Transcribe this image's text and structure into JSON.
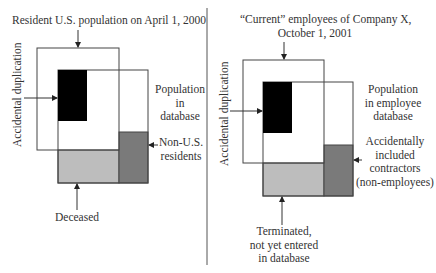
{
  "colors": {
    "black_block": "#000000",
    "dark_gray_block": "#7a7a7a",
    "light_gray_block": "#bdbdbd",
    "lines": "#333333"
  },
  "left_panel": {
    "title": "Resident U.S. population on April 1, 2000",
    "side_label": "Accidental duplication",
    "database_label_lines": [
      "Population",
      "in",
      "database"
    ],
    "right_arrow_label_lines": [
      "Non-U.S.",
      "residents"
    ],
    "bottom_label": "Deceased"
  },
  "right_panel": {
    "title_lines": [
      "“Current” employees of Company X,",
      "October 1, 2001"
    ],
    "side_label": "Accidental duplication",
    "database_label_lines": [
      "Population",
      "in employee",
      "database"
    ],
    "right_arrow_label_lines": [
      "Accidentally",
      "included",
      "contractors",
      "(non-employees)"
    ],
    "bottom_label_lines": [
      "Terminated,",
      "not yet entered",
      "in database"
    ]
  }
}
